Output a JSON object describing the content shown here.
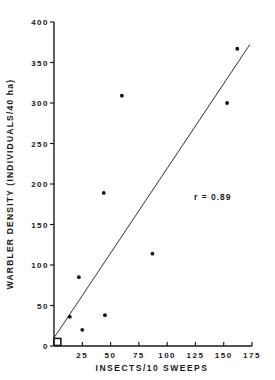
{
  "chart_data": {
    "type": "scatter",
    "title": "",
    "xlabel": "INSECTS/10 SWEEPS",
    "ylabel": "WARBLER DENSITY (INDIVIDUALS/40 ha)",
    "xlim": [
      0,
      175
    ],
    "ylim": [
      0,
      400
    ],
    "xticks": [
      25,
      50,
      75,
      100,
      125,
      150,
      175
    ],
    "yticks": [
      0,
      50,
      100,
      150,
      200,
      250,
      300,
      350,
      400
    ],
    "grid": false,
    "points": [
      {
        "x": 3,
        "y": 5,
        "marker": "square"
      },
      {
        "x": 14,
        "y": 36
      },
      {
        "x": 22,
        "y": 85
      },
      {
        "x": 25,
        "y": 20
      },
      {
        "x": 44,
        "y": 189
      },
      {
        "x": 45,
        "y": 38
      },
      {
        "x": 60,
        "y": 309
      },
      {
        "x": 87,
        "y": 114
      },
      {
        "x": 153,
        "y": 300
      },
      {
        "x": 162,
        "y": 367
      }
    ],
    "regression_line": {
      "x0": 0,
      "y0": 10,
      "x1": 173,
      "y1": 372
    },
    "annotation": "r = 0.89"
  },
  "labels": {
    "xlabel": "INSECTS/10 SWEEPS",
    "ylabel": "WARBLER DENSITY (INDIVIDUALS/40 ha)",
    "annotation": "r = 0.89"
  }
}
